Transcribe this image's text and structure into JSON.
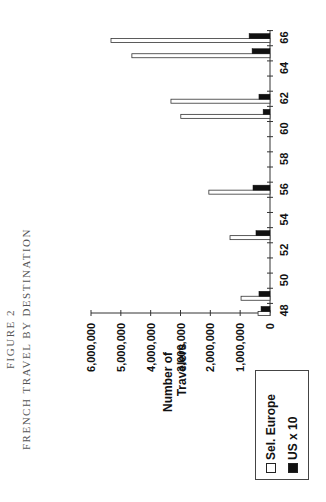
{
  "figure": {
    "number": "FIGURE 2",
    "title": "FRENCH TRAVEL BY DESTINATION"
  },
  "chart_data": {
    "type": "bar",
    "orientation": "vertical bars, page rotated 90° counter-clockwise",
    "title": "FRENCH TRAVEL BY DESTINATION",
    "subtitle": "FIGURE 2",
    "xlabel": "",
    "ylabel": "Number of Travelers",
    "x_ticks": [
      "48",
      "50",
      "52",
      "54",
      "56",
      "58",
      "60",
      "62",
      "64",
      "66"
    ],
    "y_ticks": [
      "0",
      "1,000,000",
      "2,000,000",
      "3,000,000",
      "4,000,000",
      "5,000,000",
      "6,000,000"
    ],
    "ylim": [
      0,
      6000000
    ],
    "xlim": [
      47.5,
      66.5
    ],
    "grid": false,
    "legend_position": "bottom-left (lower-left in rotated view)",
    "categories": [
      48,
      49,
      53,
      56,
      61,
      62,
      65,
      66
    ],
    "series": [
      {
        "name": "Sel. Europe",
        "fill": "#ffffff",
        "values": [
          400000,
          970000,
          1340000,
          2050000,
          2990000,
          3320000,
          4630000,
          5330000
        ]
      },
      {
        "name": "US x 10",
        "fill": "#111111",
        "values": [
          300000,
          370000,
          470000,
          570000,
          230000,
          370000,
          600000,
          700000
        ]
      }
    ]
  },
  "axis": {
    "ylabel_line1": "Number of",
    "ylabel_line2": "Travelers"
  },
  "legend": {
    "items": [
      {
        "label": "Sel. Europe",
        "swatch": "white"
      },
      {
        "label": "US x 10",
        "swatch": "black"
      }
    ]
  }
}
